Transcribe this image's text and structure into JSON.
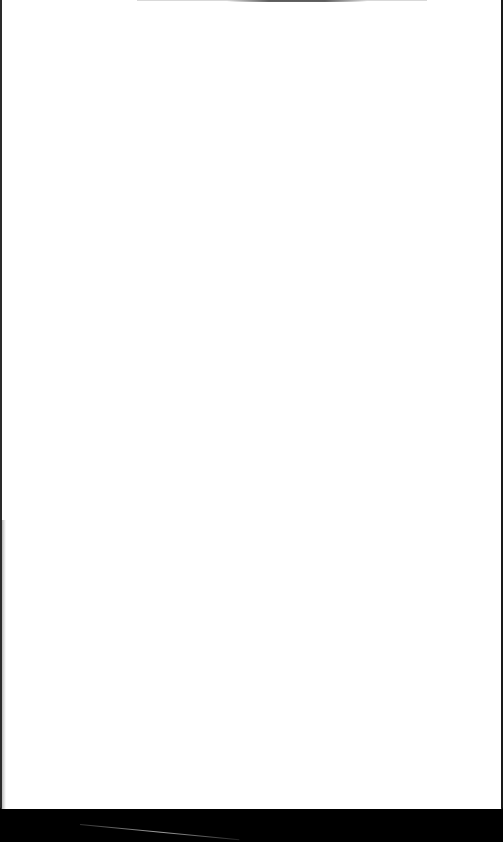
{
  "scene": {
    "description": "blank white sheet of paper photographed against a dark background",
    "sheet_color": "#ffffff",
    "background_color": "#000000",
    "text_content": []
  }
}
